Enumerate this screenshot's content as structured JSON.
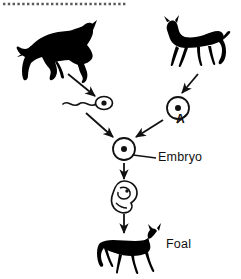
{
  "diagram": {
    "background_color": "#ffffff",
    "ink_color": "#111111",
    "top_border": {
      "style": "dotted-dashes",
      "dash_count": 26,
      "x_start": 3,
      "x_end": 127,
      "y": 4
    },
    "labels": {
      "embryo": "Embryo",
      "foal": "Foal",
      "cell_a": "A"
    },
    "nodes": [
      {
        "id": "stallion",
        "name": "parent-horse-left",
        "shape": "horse-silhouette",
        "facing": "right",
        "x": 18,
        "y": 18,
        "w": 78,
        "h": 62
      },
      {
        "id": "mare",
        "name": "parent-horse-right",
        "shape": "horse-silhouette",
        "facing": "left",
        "x": 160,
        "y": 14,
        "w": 70,
        "h": 62
      },
      {
        "id": "sperm",
        "name": "sperm-cell",
        "shape": "sperm",
        "x": 63,
        "y": 96,
        "w": 48,
        "h": 16
      },
      {
        "id": "egg",
        "name": "egg-cell",
        "shape": "circle-with-nucleus",
        "x": 166,
        "y": 96,
        "w": 24,
        "h": 24,
        "label": "A"
      },
      {
        "id": "zygote",
        "name": "zygote-embryo-cell",
        "shape": "circle-with-nucleus",
        "x": 112,
        "y": 137,
        "w": 24,
        "h": 24,
        "label": "Embryo"
      },
      {
        "id": "fetus",
        "name": "curled-fetus",
        "shape": "fetus-outline",
        "x": 112,
        "y": 181,
        "w": 26,
        "h": 30
      },
      {
        "id": "foal",
        "name": "foal-silhouette",
        "shape": "horse-silhouette",
        "facing": "right",
        "x": 97,
        "y": 222,
        "w": 66,
        "h": 52,
        "label": "Foal"
      }
    ],
    "arrows": [
      {
        "name": "arrow-stallion-to-sperm",
        "from": "stallion",
        "to": "sperm",
        "x1": 68,
        "y1": 74,
        "x2": 95,
        "y2": 95
      },
      {
        "name": "arrow-mare-to-egg",
        "from": "mare",
        "to": "egg",
        "x1": 196,
        "y1": 74,
        "x2": 180,
        "y2": 93
      },
      {
        "name": "arrow-sperm-to-zygote",
        "from": "sperm",
        "to": "zygote",
        "x1": 87,
        "y1": 113,
        "x2": 114,
        "y2": 136
      },
      {
        "name": "arrow-egg-to-zygote",
        "from": "egg",
        "to": "zygote",
        "x1": 163,
        "y1": 119,
        "x2": 135,
        "y2": 136
      },
      {
        "name": "arrow-zygote-to-fetus",
        "from": "zygote",
        "to": "fetus",
        "x1": 124,
        "y1": 164,
        "x2": 124,
        "y2": 180
      },
      {
        "name": "arrow-fetus-to-foal",
        "from": "fetus",
        "to": "foal",
        "x1": 124,
        "y1": 212,
        "x2": 124,
        "y2": 234
      }
    ],
    "leader_lines": [
      {
        "name": "leader-line-embryo",
        "from": "zygote",
        "to_label": "Embryo",
        "x1": 136,
        "y1": 148,
        "x2": 157,
        "y2": 157
      },
      {
        "name": "leader-line-a",
        "from": "egg",
        "to_label": "A",
        "x1": 186,
        "y1": 115,
        "x2": 175,
        "y2": 124
      }
    ]
  }
}
